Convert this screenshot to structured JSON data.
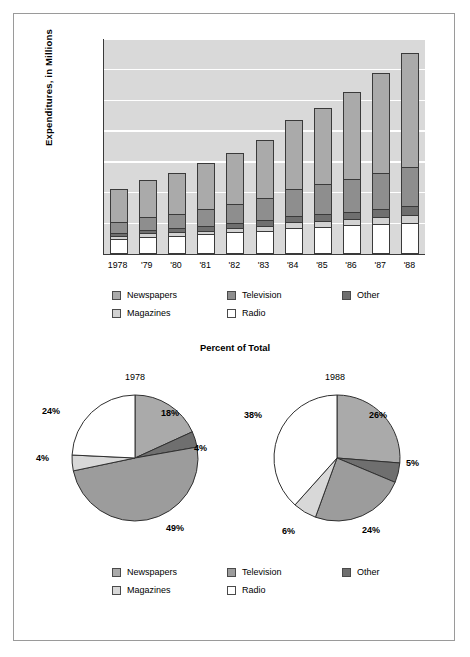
{
  "chart_data": [
    {
      "type": "bar",
      "subtype": "stacked-bar",
      "title": "",
      "xlabel": "",
      "ylabel": "Expenditures, in Millions",
      "categories": [
        "1978",
        "'79",
        "'80",
        "'81",
        "'82",
        "'83",
        "'84",
        "'85",
        "'86",
        "'87",
        "'88"
      ],
      "ylim": [
        0,
        140000
      ],
      "yticks": [
        "$0",
        "$20,000",
        "$40,000",
        "$60,000",
        "$80,000",
        "$100,000",
        "$120,000",
        "$140,000"
      ],
      "ytick_values": [
        0,
        20000,
        40000,
        60000,
        80000,
        100000,
        120000,
        140000
      ],
      "grid": true,
      "legend_position": "below",
      "stack_order_bottom_to_top": [
        "Radio",
        "Magazines",
        "Other",
        "Television",
        "Newspapers"
      ],
      "series": [
        {
          "name": "Radio",
          "color": "#ffffff",
          "values": [
            8800,
            10300,
            11000,
            11800,
            13100,
            14200,
            16000,
            16800,
            17500,
            18700,
            19300
          ]
        },
        {
          "name": "Magazines",
          "color": "#d2d2d2",
          "values": [
            1900,
            2100,
            2300,
            2500,
            2800,
            3200,
            3700,
            3900,
            4200,
            4500,
            5100
          ]
        },
        {
          "name": "Other",
          "color": "#6f6f6f",
          "values": [
            2100,
            2400,
            2600,
            2900,
            3300,
            3700,
            4200,
            4500,
            4900,
            5200,
            5700
          ]
        },
        {
          "name": "Television",
          "color": "#8e8e8e",
          "values": [
            7300,
            8500,
            9600,
            11200,
            12600,
            14900,
            17800,
            19600,
            21800,
            23600,
            25800
          ]
        },
        {
          "name": "Newspapers",
          "color": "#aaaaaa",
          "values": [
            22400,
            25200,
            27500,
            31100,
            33700,
            38500,
            45300,
            50200,
            57100,
            65700,
            75100
          ]
        }
      ],
      "totals": [
        42500,
        48500,
        53000,
        59500,
        65500,
        74500,
        87000,
        95000,
        105500,
        117700,
        131000
      ],
      "legend": [
        "Newspapers",
        "Magazines",
        "Television",
        "Radio",
        "Other"
      ]
    },
    {
      "type": "pie",
      "title": "Percent of Total",
      "year": "1978",
      "labels": [
        "Newspapers",
        "Other",
        "Television",
        "Magazines",
        "Radio"
      ],
      "values": [
        18,
        4,
        49,
        4,
        24
      ],
      "value_labels": [
        "18%",
        "4%",
        "49%",
        "4%",
        "24%"
      ],
      "colors": [
        "#aaaaaa",
        "#6f6f6f",
        "#9c9c9c",
        "#d8d8d8",
        "#ffffff"
      ],
      "legend_position": "below"
    },
    {
      "type": "pie",
      "title": "Percent of Total",
      "year": "1988",
      "labels": [
        "Newspapers",
        "Other",
        "Television",
        "Magazines",
        "Radio"
      ],
      "values": [
        26,
        5,
        24,
        6,
        38
      ],
      "value_labels": [
        "26%",
        "5%",
        "24%",
        "6%",
        "38%"
      ],
      "colors": [
        "#aaaaaa",
        "#6f6f6f",
        "#9c9c9c",
        "#d8d8d8",
        "#ffffff"
      ],
      "legend_position": "below"
    }
  ],
  "bar_chart": {
    "y_axis_label": "Expenditures, in Millions",
    "y_ticks": [
      "$140,000",
      "$120,000",
      "$100,000",
      "$80,000",
      "$60,000",
      "$40,000",
      "$20,000",
      "$0"
    ],
    "x_ticks": [
      "1978",
      "'79",
      "'80",
      "'81",
      "'82",
      "'83",
      "'84",
      "'85",
      "'86",
      "'87",
      "'88"
    ],
    "legend": [
      {
        "label": "Newspapers",
        "color": "#aaaaaa"
      },
      {
        "label": "Television",
        "color": "#8e8e8e"
      },
      {
        "label": "Other",
        "color": "#6f6f6f"
      },
      {
        "label": "Magazines",
        "color": "#d2d2d2"
      },
      {
        "label": "Radio",
        "color": "#ffffff"
      }
    ]
  },
  "pie_section": {
    "title": "Percent of Total",
    "left_year": "1978",
    "right_year": "1988",
    "left_labels": [
      "18%",
      "4%",
      "49%",
      "4%",
      "24%"
    ],
    "right_labels": [
      "26%",
      "5%",
      "24%",
      "6%",
      "38%"
    ],
    "legend": [
      {
        "label": "Newspapers",
        "color": "#aaaaaa"
      },
      {
        "label": "Television",
        "color": "#9c9c9c"
      },
      {
        "label": "Other",
        "color": "#6f6f6f"
      },
      {
        "label": "Magazines",
        "color": "#d8d8d8"
      },
      {
        "label": "Radio",
        "color": "#ffffff"
      }
    ]
  },
  "colors": {
    "plot_background": "#d9d9d9",
    "gridline": "#ffffff",
    "frame": "#9a9a9a",
    "axis": "#3a3a3a",
    "newspapers": "#aaaaaa",
    "magazines": "#d2d2d2",
    "television": "#8e8e8e",
    "other": "#6f6f6f",
    "radio": "#ffffff"
  }
}
